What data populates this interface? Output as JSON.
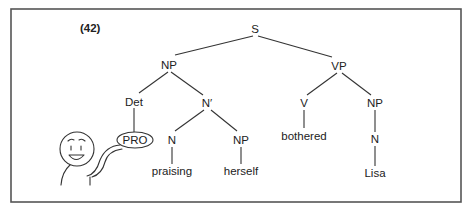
{
  "figure": {
    "example_number": "(42)",
    "frame_color": "#555555",
    "line_color": "#333333"
  },
  "tree": {
    "root": "S",
    "nodes": {
      "s": "S",
      "np_subject": "NP",
      "vp": "VP",
      "det": "Det",
      "n_bar": "N′",
      "pro": "PRO",
      "n_praising": "N",
      "np_herself": "NP",
      "v": "V",
      "np_object": "NP",
      "n_lisa": "N"
    },
    "leaves": {
      "praising": "praising",
      "herself": "herself",
      "bothered": "bothered",
      "lisa": "Lisa"
    },
    "structure": "[S [NP [Det PRO] [N′ [N praising] [NP herself]]] [VP [V bothered] [NP [N Lisa]]]]"
  },
  "illustration": {
    "description": "cartoon-figure-holding-PRO",
    "icon": "smiling-person-icon"
  }
}
